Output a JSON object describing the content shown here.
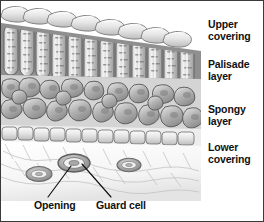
{
  "figure": {
    "border_color": "#3a3a3a",
    "background_color": "#ffffff",
    "ink_color": "#111111",
    "width": 264,
    "height": 222
  },
  "side_labels": [
    {
      "id": "upper-covering",
      "text": "Upper\ncovering"
    },
    {
      "id": "palisade-layer",
      "text": "Palisade\nlayer"
    },
    {
      "id": "spongy-layer",
      "text": "Spongy\nlayer"
    },
    {
      "id": "lower-covering",
      "text": "Lower\ncovering"
    }
  ],
  "callout_labels": [
    {
      "id": "opening",
      "text": "Opening"
    },
    {
      "id": "guard-cell",
      "text": "Guard cell"
    }
  ],
  "illustration": {
    "style": "grayscale pencil shaded botanical cross-section",
    "layers": [
      {
        "name": "upper-covering",
        "description": "single row of rounded epidermal cells across the top, sloping down to the right"
      },
      {
        "name": "palisade-layer",
        "description": "row of tall vertical column-shaped cells packed with chloroplast stippling"
      },
      {
        "name": "spongy-layer",
        "description": "irregular lobed mesophyll cells with air spaces between them"
      },
      {
        "name": "lower-covering",
        "description": "row of small epidermal cells above a pale under-surface showing three stomata"
      }
    ],
    "stomata": [
      {
        "cx": 38,
        "cy": 173,
        "rx": 13,
        "ry": 7
      },
      {
        "cx": 73,
        "cy": 162,
        "rx": 16,
        "ry": 8.5
      },
      {
        "cx": 128,
        "cy": 164,
        "rx": 12,
        "ry": 6.5
      }
    ],
    "leader_lines": [
      {
        "for": "opening",
        "from": [
          47,
          197
        ],
        "to": [
          70,
          165
        ]
      },
      {
        "for": "guard-cell",
        "from": [
          110,
          197
        ],
        "to": [
          81,
          164
        ]
      }
    ]
  }
}
